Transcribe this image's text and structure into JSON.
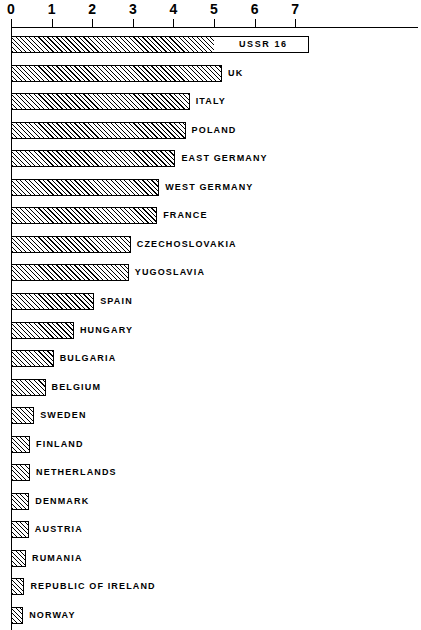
{
  "chart_data": {
    "type": "bar",
    "orientation": "horizontal",
    "title": "",
    "subtitle": "",
    "xlabel": "",
    "ylabel": "",
    "xlim": [
      0,
      7.6
    ],
    "grid": false,
    "legend": null,
    "axis_ticks": [
      "0",
      "1",
      "2",
      "3",
      "4",
      "5",
      "6",
      "7"
    ],
    "axis_tick_values": [
      0,
      1,
      2,
      3,
      4,
      5,
      6,
      7
    ],
    "note": "Top bar (USSR) is truncated/broken; its true value 16 is printed inside the bar.",
    "categories": [
      "USSR",
      "UK",
      "ITALY",
      "POLAND",
      "EAST GERMANY",
      "WEST GERMANY",
      "FRANCE",
      "CZECHOSLOVAKIA",
      "YUGOSLAVIA",
      "SPAIN",
      "HUNGARY",
      "BULGARIA",
      "BELGIUM",
      "SWEDEN",
      "FINLAND",
      "NETHERLANDS",
      "DENMARK",
      "AUSTRIA",
      "RUMANIA",
      "REPUBLIC OF IRELAND",
      "NORWAY",
      "SWITZERLAND",
      "ALBANIA"
    ],
    "values": [
      16,
      5.2,
      4.4,
      4.3,
      4.05,
      3.65,
      3.6,
      2.95,
      2.9,
      2.05,
      1.55,
      1.05,
      0.85,
      0.57,
      0.47,
      0.47,
      0.45,
      0.44,
      0.37,
      0.33,
      0.3,
      0.3,
      0.27
    ]
  },
  "axis": {
    "ticks": [
      {
        "label": "0",
        "value": 0
      },
      {
        "label": "1",
        "value": 1
      },
      {
        "label": "2",
        "value": 2
      },
      {
        "label": "3",
        "value": 3
      },
      {
        "label": "4",
        "value": 4
      },
      {
        "label": "5",
        "value": 5
      },
      {
        "label": "6",
        "value": 6
      },
      {
        "label": "7",
        "value": 7
      }
    ]
  },
  "bars": [
    {
      "label": "USSR  16",
      "display_label": "USSR  16",
      "value": 16,
      "broken": true,
      "fill_end": 5.0,
      "frame_end": 7.35
    },
    {
      "label": "UK",
      "value": 5.2,
      "broken": false
    },
    {
      "label": "ITALY",
      "value": 4.4,
      "broken": false
    },
    {
      "label": "POLAND",
      "value": 4.3,
      "broken": false
    },
    {
      "label": "EAST GERMANY",
      "value": 4.05,
      "broken": false
    },
    {
      "label": "WEST GERMANY",
      "value": 3.65,
      "broken": false
    },
    {
      "label": "FRANCE",
      "value": 3.6,
      "broken": false
    },
    {
      "label": "CZECHOSLOVAKIA",
      "value": 2.95,
      "broken": false
    },
    {
      "label": "YUGOSLAVIA",
      "value": 2.9,
      "broken": false
    },
    {
      "label": "SPAIN",
      "value": 2.05,
      "broken": false
    },
    {
      "label": "HUNGARY",
      "value": 1.55,
      "broken": false
    },
    {
      "label": "BULGARIA",
      "value": 1.05,
      "broken": false
    },
    {
      "label": "BELGIUM",
      "value": 0.85,
      "broken": false
    },
    {
      "label": "SWEDEN",
      "value": 0.57,
      "broken": false
    },
    {
      "label": "FINLAND",
      "value": 0.47,
      "broken": false
    },
    {
      "label": "NETHERLANDS",
      "value": 0.47,
      "broken": false
    },
    {
      "label": "DENMARK",
      "value": 0.45,
      "broken": false
    },
    {
      "label": "AUSTRIA",
      "value": 0.44,
      "broken": false
    },
    {
      "label": "RUMANIA",
      "value": 0.37,
      "broken": false
    },
    {
      "label": "REPUBLIC OF IRELAND",
      "value": 0.33,
      "broken": false
    },
    {
      "label": "NORWAY",
      "value": 0.3,
      "broken": false
    },
    {
      "label": "SWITZERLAND",
      "value": 0.3,
      "broken": false
    },
    {
      "label": "ALBANIA",
      "value": 0.27,
      "broken": false
    }
  ],
  "colors": {
    "ink": "#000000",
    "paper": "#ffffff"
  }
}
